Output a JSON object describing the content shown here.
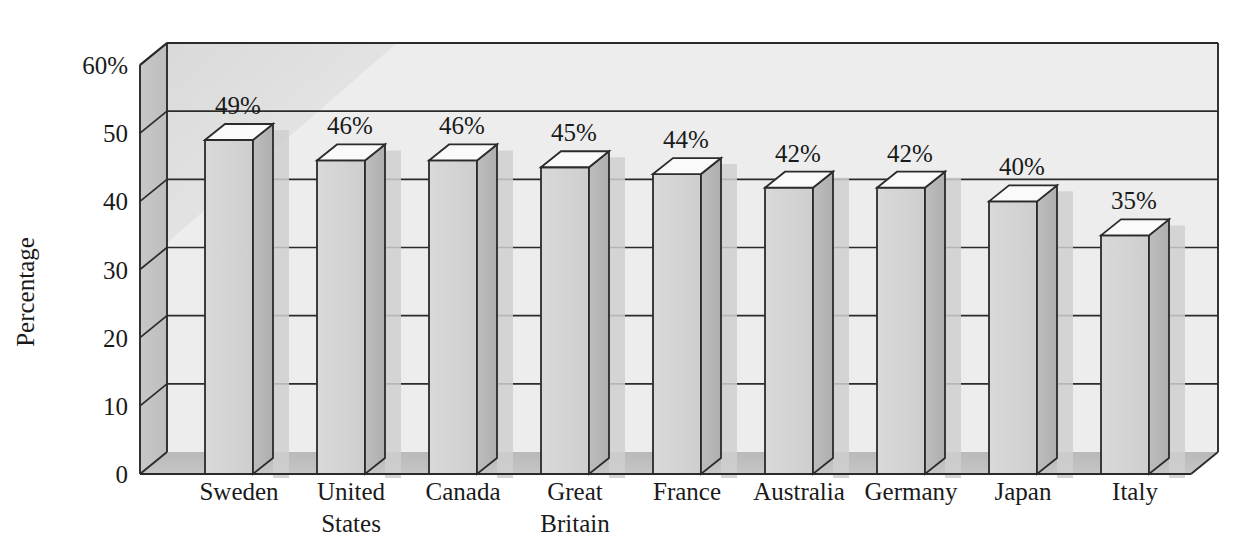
{
  "chart_data": {
    "type": "bar",
    "title": "",
    "subtitle": "",
    "xlabel": "",
    "ylabel": "Percentage",
    "categories": [
      "Sweden",
      "United States",
      "Canada",
      "Great Britain",
      "France",
      "Australia",
      "Germany",
      "Japan",
      "Italy"
    ],
    "category_lines": [
      [
        "Sweden"
      ],
      [
        "United",
        "States"
      ],
      [
        "Canada"
      ],
      [
        "Great",
        "Britain"
      ],
      [
        "France"
      ],
      [
        "Australia"
      ],
      [
        "Germany"
      ],
      [
        "Japan"
      ],
      [
        "Italy"
      ]
    ],
    "values": [
      49,
      46,
      46,
      45,
      44,
      42,
      42,
      40,
      35
    ],
    "data_labels": [
      "49%",
      "46%",
      "46%",
      "45%",
      "44%",
      "42%",
      "42%",
      "40%",
      "35%"
    ],
    "ylim": [
      0,
      60
    ],
    "ytick_values": [
      0,
      10,
      20,
      30,
      40,
      50,
      60
    ],
    "ytick_labels": [
      "0",
      "10",
      "20",
      "30",
      "40",
      "50",
      "60%"
    ],
    "grid": true,
    "grid_axis": "y",
    "legend": false,
    "legend_position": "none",
    "style": "3d-extruded-bars",
    "colors": {
      "bar_front": "#d2d2d2",
      "bar_side": "#b4b4b4",
      "bar_top": "#fafafa",
      "back_wall": "#ededed",
      "left_wall": "#c3c3c3",
      "floor": "#bdbdbd",
      "shadow": "#cfcfcf",
      "outline": "#2b2b2b",
      "text": "#1a1a1a"
    }
  }
}
